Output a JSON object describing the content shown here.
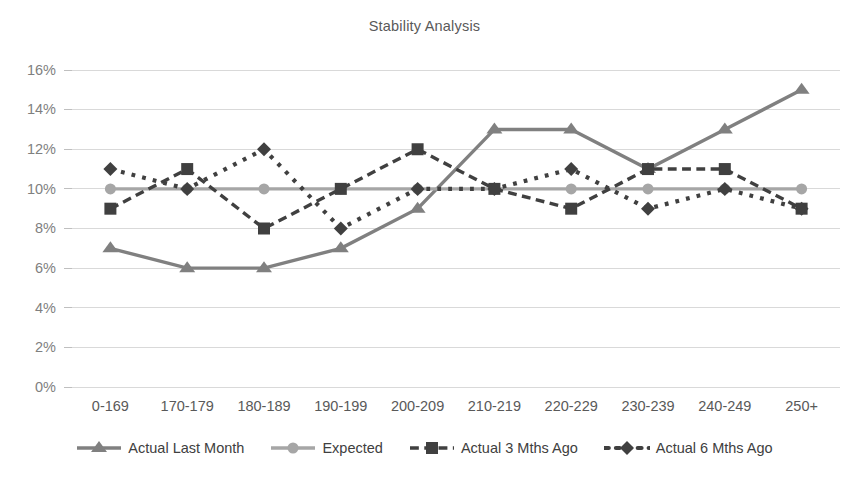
{
  "chart_data": {
    "type": "line",
    "title": "Stability Analysis",
    "xlabel": "",
    "ylabel": "",
    "ylim": [
      0,
      16
    ],
    "ytick_labels": [
      "0%",
      "2%",
      "4%",
      "6%",
      "8%",
      "10%",
      "12%",
      "14%",
      "16%"
    ],
    "ytick_values": [
      0,
      2,
      4,
      6,
      8,
      10,
      12,
      14,
      16
    ],
    "grid": true,
    "legend_position": "bottom",
    "categories": [
      "0-169",
      "170-179",
      "180-189",
      "190-199",
      "200-209",
      "210-219",
      "220-229",
      "230-239",
      "240-249",
      "250+"
    ],
    "series": [
      {
        "name": "Actual Last Month",
        "values": [
          7,
          6,
          6,
          7,
          9,
          13,
          13,
          11,
          13,
          15
        ],
        "color": "#808080",
        "marker": "triangle",
        "line_style": "solid"
      },
      {
        "name": "Expected",
        "values": [
          10,
          10,
          10,
          10,
          10,
          10,
          10,
          10,
          10,
          10
        ],
        "color": "#a6a6a6",
        "marker": "circle",
        "line_style": "solid"
      },
      {
        "name": "Actual 3 Mths Ago",
        "values": [
          9,
          11,
          8,
          10,
          12,
          10,
          9,
          11,
          11,
          9
        ],
        "color": "#404040",
        "marker": "square",
        "line_style": "dashed"
      },
      {
        "name": "Actual 6 Mths Ago",
        "values": [
          11,
          10,
          12,
          8,
          10,
          10,
          11,
          9,
          10,
          9
        ],
        "color": "#404040",
        "marker": "diamond",
        "line_style": "dotted"
      }
    ]
  }
}
